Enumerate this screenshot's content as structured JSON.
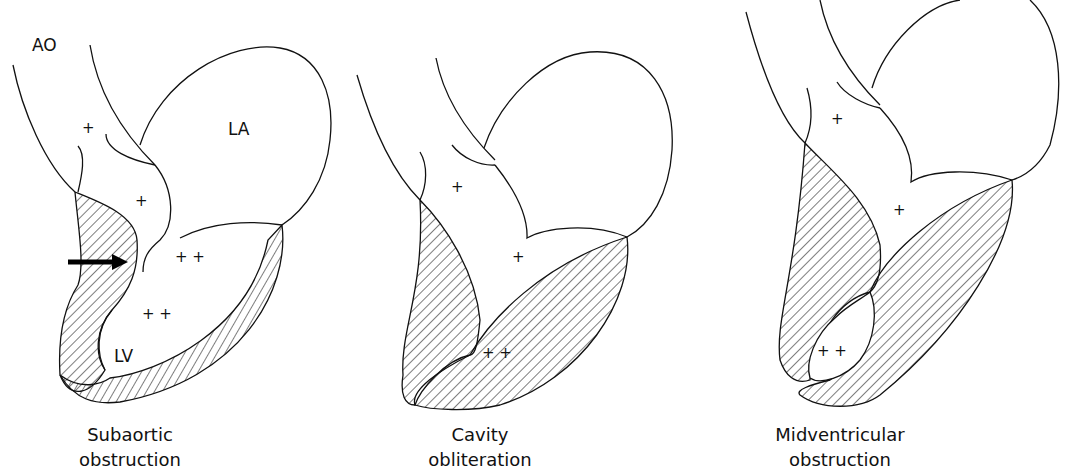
{
  "figure": {
    "panels": [
      {
        "caption_line1": "Subaortic",
        "caption_line2": "obstruction",
        "labels": {
          "aorta": "AO",
          "left_atrium": "LA",
          "left_ventricle": "LV"
        },
        "pressure_marks": [
          "+",
          "+",
          "+ +",
          "+ +"
        ],
        "arrow": "obstruction-arrow"
      },
      {
        "caption_line1": "Cavity",
        "caption_line2": "obliteration",
        "pressure_marks": [
          "+",
          "+",
          "+ +"
        ]
      },
      {
        "caption_line1": "Midventricular",
        "caption_line2": "obstruction",
        "pressure_marks": [
          "+",
          "+",
          "+ +"
        ]
      }
    ],
    "colors": {
      "line": "#111111",
      "background": "#ffffff"
    }
  }
}
